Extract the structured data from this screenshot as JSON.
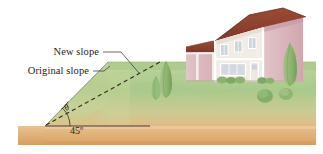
{
  "figure": {
    "width": 323,
    "height": 154,
    "background": "#ffffff"
  },
  "labels": {
    "new_slope": "New slope",
    "original_slope": "Original slope",
    "angle_new": "θ",
    "angle_original": "45º"
  },
  "colors": {
    "sky": "#ffffff",
    "grass_light": "#cfe0b4",
    "grass_mid": "#b3cf96",
    "grass_dark": "#9bbd80",
    "soil_light": "#e9c79a",
    "soil_mid": "#e0b177",
    "soil_dark": "#d9a163",
    "roof": "#8a3f2e",
    "roof_shade": "#6f3224",
    "wall_pink": "#dcb8bd",
    "wall_pink_shade": "#cda2a9",
    "wall_cream": "#f2ece6",
    "trim_white": "#ffffff",
    "window_glass": "#cdd4dc",
    "shrub_green": "#8fb574",
    "shrub_dark": "#6f9a57",
    "ink": "#2b2119",
    "dash_line": "#3a2e22"
  },
  "geometry": {
    "original_slope_angle_deg": 45,
    "new_slope_angle_label": "θ",
    "base_ground_y": 126,
    "hill_toe_x": 45,
    "hill_crest_x": 108,
    "hill_crest_y": 62
  },
  "annotations": {
    "leader_new_slope": "line from New slope label to dashed new-slope line",
    "leader_original_slope": "line from Original slope label to hill crest edge",
    "dashed_line_meaning": "proposed regraded (new) slope",
    "solid_hill_edge_meaning": "existing (original) 45 degree slope"
  },
  "scene_objects": [
    {
      "name": "house",
      "description": "two-story house with dark red roof, cream upper facade, pink lower walls"
    },
    {
      "name": "garage-wing",
      "description": "lower pink wing at left of house with dark roof"
    },
    {
      "name": "cypress-shrub-left",
      "description": "tall conical shrub on hillside"
    },
    {
      "name": "cypress-shrub-left-small",
      "description": "small conical shrub on hillside"
    },
    {
      "name": "cypress-shrub-right",
      "description": "tall conical shrub right of house"
    },
    {
      "name": "foundation-hedges",
      "description": "row of low hedges along house foundation"
    },
    {
      "name": "round-bush-a",
      "description": "round bush on lawn"
    },
    {
      "name": "round-bush-b",
      "description": "round bush on lawn"
    }
  ]
}
